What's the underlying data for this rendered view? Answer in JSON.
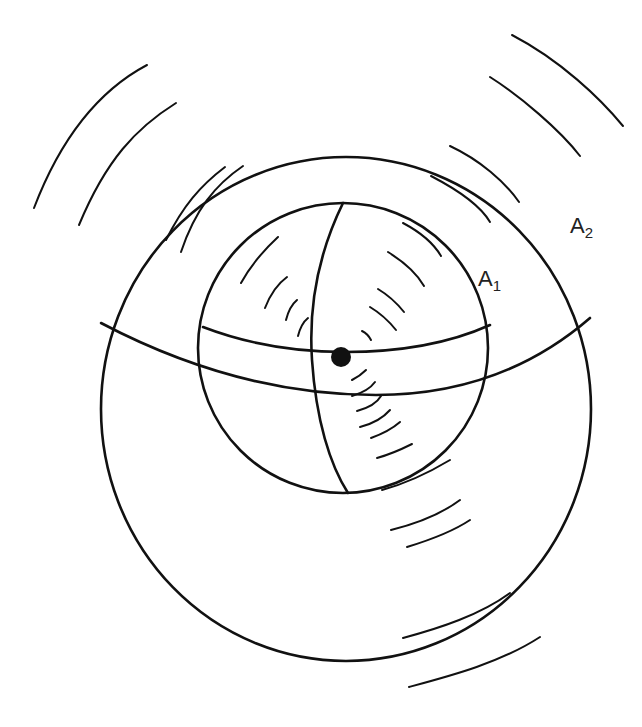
{
  "diagram": {
    "colors": {
      "line": "#111111",
      "background": "#ffffff",
      "text": "#222222"
    },
    "source": {
      "cx": 341,
      "cy": 357,
      "r": 10
    },
    "outer_sphere": {
      "label_main": "A",
      "label_sub": "2",
      "cx": 341,
      "cy": 410,
      "r": 255
    },
    "inner_sphere": {
      "label_main": "A",
      "label_sub": "1",
      "cx": 341,
      "cy": 320,
      "r": 142
    },
    "labels": {
      "a1": {
        "main": "A",
        "sub": "1",
        "x": 478,
        "y": 268
      },
      "a2": {
        "main": "A",
        "sub": "2",
        "x": 570,
        "y": 215
      }
    }
  }
}
